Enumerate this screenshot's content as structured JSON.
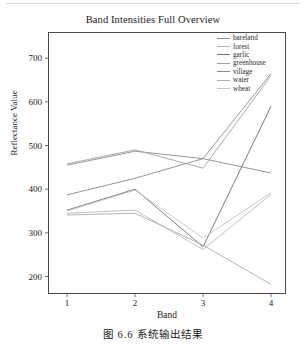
{
  "figure": {
    "caption": "图 6.6   系统输出结果"
  },
  "chart_data": {
    "type": "line",
    "title": "Band Intensities Full Overview",
    "xlabel": "Band",
    "ylabel": "Reflectance Value",
    "x": [
      1,
      2,
      3,
      4
    ],
    "xticklabels": [
      "1",
      "2",
      "3",
      "4"
    ],
    "yticks": [
      200,
      300,
      400,
      500,
      600,
      700
    ],
    "yticklabels": [
      "200",
      "300",
      "400",
      "500",
      "600",
      "700"
    ],
    "xlim": [
      0.72,
      4.22
    ],
    "ylim": [
      160,
      760
    ],
    "grid": false,
    "legend_position": "upper right",
    "series": [
      {
        "name": "bareland",
        "values": [
          455,
          487,
          470,
          665
        ],
        "color": "#8d8d8d"
      },
      {
        "name": "forest",
        "values": [
          345,
          352,
          262,
          388
        ],
        "color": "#b9b9b9"
      },
      {
        "name": "garlic",
        "values": [
          352,
          400,
          268,
          590
        ],
        "color": "#6f6f6f"
      },
      {
        "name": "greenhouse",
        "values": [
          458,
          490,
          448,
          660
        ],
        "color": "#a2a2a2"
      },
      {
        "name": "village",
        "values": [
          387,
          425,
          470,
          437
        ],
        "color": "#8a8a8a"
      },
      {
        "name": "water",
        "values": [
          341,
          345,
          272,
          182
        ],
        "color": "#adadad"
      },
      {
        "name": "wheat",
        "values": [
          350,
          398,
          288,
          392
        ],
        "color": "#c2c2c2"
      }
    ]
  },
  "legend": {
    "items": [
      {
        "label": "bareland"
      },
      {
        "label": "forest"
      },
      {
        "label": "garlic"
      },
      {
        "label": "greenhouse"
      },
      {
        "label": "village"
      },
      {
        "label": "water"
      },
      {
        "label": "wheat"
      }
    ]
  }
}
